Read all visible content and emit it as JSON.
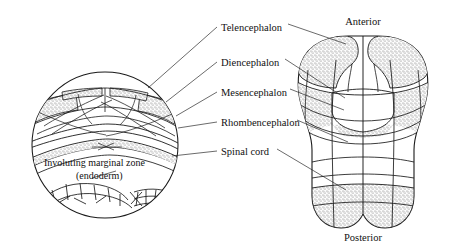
{
  "figure": {
    "background": "#ffffff",
    "ink": "#1a1a1a",
    "stipple": "#6d6d6d"
  },
  "labels": {
    "telencephalon": "Telencephalon",
    "diencephalon": "Diencephalon",
    "mesencephalon": "Mesencephalon",
    "rhombencephalon": "Rhombencephalon",
    "spinal_cord": "Spinal cord",
    "involuting_zone_line1": "Involuting marginal zone",
    "involuting_zone_line2": "(endoderm)",
    "anterior": "Anterior",
    "posterior": "Posterior"
  }
}
